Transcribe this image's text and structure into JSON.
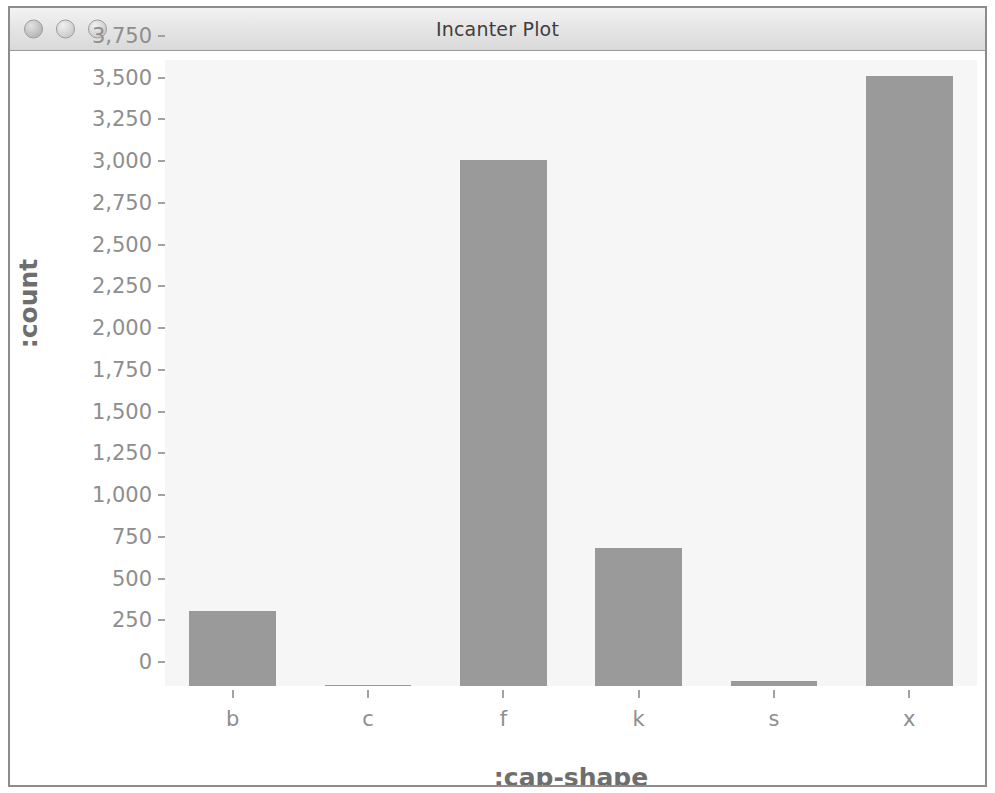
{
  "window": {
    "title": "Incanter Plot",
    "controls": [
      {
        "name": "close",
        "label": "Close"
      },
      {
        "name": "minimize",
        "label": "Minimize"
      },
      {
        "name": "zoom",
        "label": "Zoom"
      }
    ]
  },
  "colors": {
    "bar_fill": "#9a9a9a",
    "plot_background": "#f6f6f6",
    "window_background": "#ffffff",
    "axis_text": "#8e8e8e",
    "axis_label": "#6e6e6e",
    "titlebar_text": "#3e3e3e"
  },
  "chart_data": {
    "type": "bar",
    "title": "",
    "xlabel": ":cap-shape",
    "ylabel": ":count",
    "categories": [
      "b",
      "c",
      "f",
      "k",
      "s",
      "x"
    ],
    "values": [
      452,
      4,
      3152,
      828,
      32,
      3656
    ],
    "ylim": [
      0,
      3750
    ],
    "ytick_values": [
      0,
      250,
      500,
      750,
      1000,
      1250,
      1500,
      1750,
      2000,
      2250,
      2500,
      2750,
      3000,
      3250,
      3500,
      3750
    ],
    "ytick_labels": [
      "0",
      "250",
      "500",
      "750",
      "1,000",
      "1,250",
      "1,500",
      "1,750",
      "2,000",
      "2,250",
      "2,500",
      "2,750",
      "3,000",
      "3,250",
      "3,500",
      "3,750"
    ],
    "grid": false,
    "legend": false
  }
}
